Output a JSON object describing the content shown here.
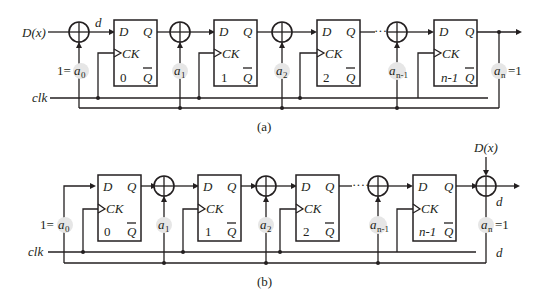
{
  "diagram": {
    "type": "LFSR CRC encoder circuits",
    "colors": {
      "line": "#231f20",
      "coef_highlight": "#e6e6e6",
      "background": "#ffffff"
    },
    "panel_a": {
      "caption": "(a)",
      "input_label": "D(x)",
      "feedback_label": "d",
      "clock_label": "clk",
      "a0_prefix": "1=",
      "an_suffix": "=1",
      "coefficients": [
        {
          "base": "a",
          "sub": "0"
        },
        {
          "base": "a",
          "sub": "1"
        },
        {
          "base": "a",
          "sub": "2"
        },
        {
          "base": "a",
          "sub": "n-1"
        },
        {
          "base": "a",
          "sub": "n"
        }
      ],
      "flipflops": [
        {
          "d": "D",
          "q": "Q",
          "ck": "CK",
          "qbar": "Q",
          "index": "0"
        },
        {
          "d": "D",
          "q": "Q",
          "ck": "CK",
          "qbar": "Q",
          "index": "1"
        },
        {
          "d": "D",
          "q": "Q",
          "ck": "CK",
          "qbar": "Q",
          "index": "2"
        },
        {
          "d": "D",
          "q": "Q",
          "ck": "CK",
          "qbar": "Q",
          "index": "n-1"
        }
      ],
      "ellipsis": "····"
    },
    "panel_b": {
      "caption": "(b)",
      "input_label": "D(x)",
      "output_label": "d",
      "feedback_label": "d",
      "clock_label": "clk",
      "a0_prefix": "1=",
      "an_suffix": "=1",
      "coefficients": [
        {
          "base": "a",
          "sub": "0"
        },
        {
          "base": "a",
          "sub": "1"
        },
        {
          "base": "a",
          "sub": "2"
        },
        {
          "base": "a",
          "sub": "n-1"
        },
        {
          "base": "a",
          "sub": "n"
        }
      ],
      "flipflops": [
        {
          "d": "D",
          "q": "Q",
          "ck": "CK",
          "qbar": "Q",
          "index": "0"
        },
        {
          "d": "D",
          "q": "Q",
          "ck": "CK",
          "qbar": "Q",
          "index": "1"
        },
        {
          "d": "D",
          "q": "Q",
          "ck": "CK",
          "qbar": "Q",
          "index": "2"
        },
        {
          "d": "D",
          "q": "Q",
          "ck": "CK",
          "qbar": "Q",
          "index": "n-1"
        }
      ],
      "ellipsis": "····"
    }
  }
}
